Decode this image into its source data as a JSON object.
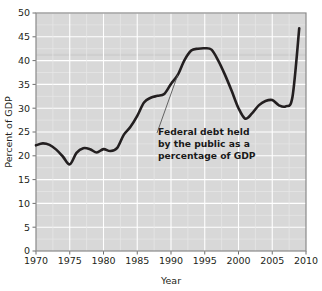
{
  "chart_data": {
    "type": "line",
    "title": "",
    "xlabel": "Year",
    "ylabel": "Percent of GDP",
    "xlim": [
      1970,
      2010
    ],
    "ylim": [
      0,
      50
    ],
    "grid": true,
    "legend": "none",
    "x_ticks": [
      "1970",
      "1975",
      "1980",
      "1985",
      "1990",
      "1995",
      "2000",
      "2005",
      "2010"
    ],
    "y_ticks": [
      "0",
      "5",
      "10",
      "15",
      "20",
      "25",
      "30",
      "35",
      "40",
      "45",
      "50"
    ],
    "annotations": [
      {
        "id": "series-callout",
        "line1": "Federal debt held",
        "line2": "by the public as a",
        "line3": "percentage of GDP",
        "points_to_year": 1991,
        "points_to_value": 37.0
      }
    ],
    "series": [
      {
        "name": "Federal debt held by the public as a percentage of GDP",
        "color": "#231f20",
        "x": [
          1970,
          1971,
          1972,
          1973,
          1974,
          1975,
          1976,
          1977,
          1978,
          1979,
          1980,
          1981,
          1982,
          1983,
          1984,
          1985,
          1986,
          1987,
          1988,
          1989,
          1990,
          1991,
          1992,
          1993,
          1994,
          1995,
          1996,
          1997,
          1998,
          1999,
          2000,
          2001,
          2002,
          2003,
          2004,
          2005,
          2006,
          2007,
          2008,
          2009
        ],
        "values": [
          22.2,
          22.6,
          22.3,
          21.3,
          19.8,
          18.2,
          20.6,
          21.6,
          21.4,
          20.7,
          21.4,
          21.0,
          21.6,
          24.4,
          26.1,
          28.4,
          31.2,
          32.2,
          32.6,
          33.0,
          35.1,
          37.0,
          40.1,
          42.1,
          42.5,
          42.6,
          42.3,
          40.0,
          37.0,
          33.6,
          30.0,
          27.8,
          28.9,
          30.6,
          31.5,
          31.7,
          30.6,
          30.4,
          32.4,
          46.8
        ]
      }
    ]
  }
}
